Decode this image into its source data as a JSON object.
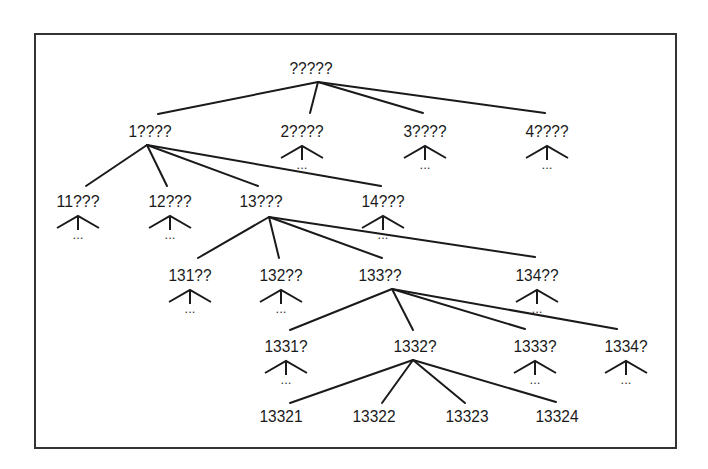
{
  "diagram": {
    "type": "tree",
    "title": "",
    "ellipsis": "...",
    "colors": {
      "line": "#1a1a1a",
      "frame": "#333333",
      "background": "#ffffff"
    },
    "nodes": [
      {
        "id": "root",
        "label": "?????",
        "x": 311,
        "y": 70,
        "anchor": [
          318,
          82
        ],
        "collapsed": false
      },
      {
        "id": "n1",
        "label": "1????",
        "x": 150,
        "y": 133,
        "anchor": [
          147,
          145
        ],
        "collapsed": false
      },
      {
        "id": "n2",
        "label": "2????",
        "x": 302,
        "y": 133,
        "collapsed": true
      },
      {
        "id": "n3",
        "label": "3????",
        "x": 425,
        "y": 133,
        "collapsed": true
      },
      {
        "id": "n4",
        "label": "4????",
        "x": 547,
        "y": 133,
        "collapsed": true
      },
      {
        "id": "n11",
        "label": "11???",
        "x": 78,
        "y": 203,
        "collapsed": true
      },
      {
        "id": "n12",
        "label": "12???",
        "x": 170,
        "y": 203,
        "collapsed": true
      },
      {
        "id": "n13",
        "label": "13???",
        "x": 261,
        "y": 203,
        "anchor": [
          269,
          217
        ],
        "collapsed": false
      },
      {
        "id": "n14",
        "label": "14???",
        "x": 383,
        "y": 203,
        "collapsed": true
      },
      {
        "id": "n131",
        "label": "131??",
        "x": 190,
        "y": 277,
        "collapsed": true
      },
      {
        "id": "n132",
        "label": "132??",
        "x": 281,
        "y": 277,
        "collapsed": true
      },
      {
        "id": "n133",
        "label": "133??",
        "x": 380,
        "y": 277,
        "anchor": [
          392,
          289
        ],
        "collapsed": false
      },
      {
        "id": "n134",
        "label": "134??",
        "x": 537,
        "y": 277,
        "collapsed": true
      },
      {
        "id": "n1331",
        "label": "1331?",
        "x": 286,
        "y": 348,
        "collapsed": true
      },
      {
        "id": "n1332",
        "label": "1332?",
        "x": 415,
        "y": 348,
        "anchor": [
          413,
          360
        ],
        "collapsed": false
      },
      {
        "id": "n1333",
        "label": "1333?",
        "x": 535,
        "y": 348,
        "collapsed": true
      },
      {
        "id": "n1334",
        "label": "1334?",
        "x": 626,
        "y": 348,
        "collapsed": true
      },
      {
        "id": "n13321",
        "label": "13321",
        "x": 281,
        "y": 418,
        "collapsed": false
      },
      {
        "id": "n13322",
        "label": "13322",
        "x": 374,
        "y": 418,
        "collapsed": false
      },
      {
        "id": "n13323",
        "label": "13323",
        "x": 467,
        "y": 418,
        "collapsed": false
      },
      {
        "id": "n13324",
        "label": "13324",
        "x": 557,
        "y": 418,
        "collapsed": false
      }
    ],
    "edges": [
      {
        "from": "root",
        "to": "n1",
        "end": [
          158,
          114
        ]
      },
      {
        "from": "root",
        "to": "n2",
        "end": [
          310,
          113
        ]
      },
      {
        "from": "root",
        "to": "n3",
        "end": [
          423,
          113
        ]
      },
      {
        "from": "root",
        "to": "n4",
        "end": [
          545,
          113
        ]
      },
      {
        "from": "n1",
        "to": "n11",
        "end": [
          86,
          186
        ]
      },
      {
        "from": "n1",
        "to": "n12",
        "end": [
          167,
          186
        ]
      },
      {
        "from": "n1",
        "to": "n13",
        "end": [
          258,
          186
        ]
      },
      {
        "from": "n1",
        "to": "n14",
        "end": [
          381,
          186
        ]
      },
      {
        "from": "n13",
        "to": "n131",
        "end": [
          198,
          258
        ]
      },
      {
        "from": "n13",
        "to": "n132",
        "end": [
          279,
          258
        ]
      },
      {
        "from": "n13",
        "to": "n133",
        "end": [
          382,
          258
        ]
      },
      {
        "from": "n13",
        "to": "n134",
        "end": [
          535,
          257
        ]
      },
      {
        "from": "n133",
        "to": "n1331",
        "end": [
          290,
          330
        ]
      },
      {
        "from": "n133",
        "to": "n1332",
        "end": [
          413,
          330
        ]
      },
      {
        "from": "n133",
        "to": "n1333",
        "end": [
          525,
          329
        ]
      },
      {
        "from": "n133",
        "to": "n1334",
        "end": [
          617,
          329
        ]
      },
      {
        "from": "n1332",
        "to": "n13321",
        "end": [
          290,
          403
        ]
      },
      {
        "from": "n1332",
        "to": "n13322",
        "end": [
          382,
          403
        ]
      },
      {
        "from": "n1332",
        "to": "n13323",
        "end": [
          465,
          403
        ]
      },
      {
        "from": "n1332",
        "to": "n13324",
        "end": [
          556,
          402
        ]
      }
    ]
  }
}
